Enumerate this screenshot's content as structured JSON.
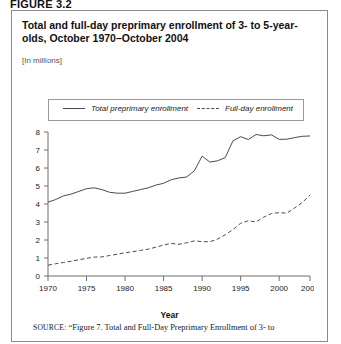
{
  "figure": {
    "label": "FIGURE 3.2"
  },
  "chart": {
    "title": "Total and full-day preprimary enrollment of 3- to 5-year-olds, October 1970–October 2004",
    "subtitle": "[In millions]",
    "x_axis_title": "Year"
  },
  "legend": {
    "items": [
      {
        "label": "Total preprimary enrollment",
        "style": "solid"
      },
      {
        "label": "Full-day enrollment",
        "style": "dashed"
      }
    ]
  },
  "source": {
    "kicker": "SOURCE:",
    "text": "“Figure 7. Total and Full-Day Preprimary Enrollment of 3- to"
  },
  "chart_data": {
    "type": "line",
    "title": "Total and full-day preprimary enrollment of 3- to 5-year-olds, October 1970–October 2004",
    "subtitle": "[In millions]",
    "xlabel": "Year",
    "ylabel": "",
    "xlim": [
      1970,
      2004
    ],
    "ylim": [
      0,
      8
    ],
    "yticks": [
      0,
      1,
      2,
      3,
      4,
      5,
      6,
      7,
      8
    ],
    "xticks": [
      1970,
      1975,
      1980,
      1985,
      1990,
      1995,
      2000,
      2004
    ],
    "grid": false,
    "legend_position": "top",
    "x": [
      1970,
      1971,
      1972,
      1973,
      1974,
      1975,
      1976,
      1977,
      1978,
      1979,
      1980,
      1981,
      1982,
      1983,
      1984,
      1985,
      1986,
      1987,
      1988,
      1989,
      1990,
      1991,
      1992,
      1993,
      1994,
      1995,
      1996,
      1997,
      1998,
      1999,
      2000,
      2001,
      2002,
      2003,
      2004
    ],
    "series": [
      {
        "name": "Total preprimary enrollment",
        "style": "solid",
        "color": "#4a4a55",
        "values": [
          4.1,
          4.25,
          4.45,
          4.55,
          4.7,
          4.85,
          4.9,
          4.8,
          4.65,
          4.6,
          4.6,
          4.7,
          4.8,
          4.9,
          5.05,
          5.15,
          5.35,
          5.45,
          5.5,
          5.85,
          6.66,
          6.33,
          6.4,
          6.58,
          7.51,
          7.74,
          7.58,
          7.86,
          7.79,
          7.84,
          7.59,
          7.6,
          7.69,
          7.76,
          7.78
        ]
      },
      {
        "name": "Full-day enrollment",
        "style": "dashed",
        "color": "#4a4a55",
        "values": [
          0.6,
          0.68,
          0.75,
          0.82,
          0.9,
          0.98,
          1.05,
          1.06,
          1.14,
          1.21,
          1.29,
          1.35,
          1.42,
          1.49,
          1.6,
          1.72,
          1.81,
          1.76,
          1.85,
          1.95,
          1.91,
          1.9,
          2.05,
          2.29,
          2.58,
          2.93,
          3.07,
          3.0,
          3.27,
          3.47,
          3.52,
          3.49,
          3.78,
          4.08,
          4.49
        ]
      }
    ]
  }
}
